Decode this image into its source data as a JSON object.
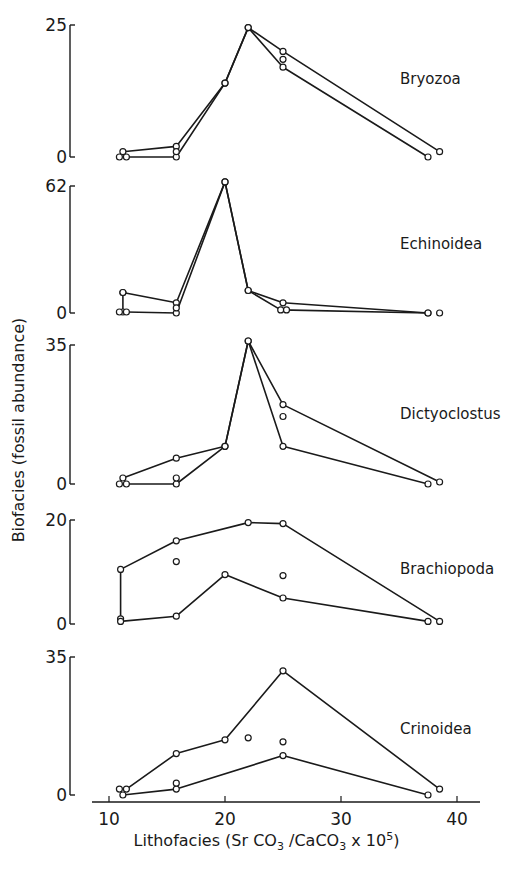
{
  "chart_data": {
    "type": "line",
    "title": "",
    "xlabel": "Lithofacies (Sr CO3 / CaCO3 x 10^5)",
    "xlabel_parts": {
      "pre": "Lithofacies (Sr CO",
      "sub1": "3",
      "mid": " /CaCO",
      "sub2": "3",
      "post": " x 10",
      "sup": "5",
      "close": ")"
    },
    "ylabel": "Biofacies (fossil abundance)",
    "xlim": [
      8,
      42
    ],
    "xticks": [
      10,
      20,
      30,
      40
    ],
    "grid": false,
    "legend": "none (panel labels at right)",
    "panels": [
      {
        "name": "Bryozoa",
        "ylim": [
          0,
          25
        ],
        "yticks": [
          "0",
          "25"
        ],
        "series": [
          {
            "name": "line A",
            "points": [
              [
                11.2,
                1
              ],
              [
                15.8,
                2
              ],
              [
                20,
                14
              ],
              [
                22,
                24.5
              ],
              [
                25,
                20
              ],
              [
                38.5,
                1
              ]
            ]
          },
          {
            "name": "line B",
            "points": [
              [
                11.5,
                0
              ],
              [
                15.8,
                0
              ],
              [
                20,
                14
              ],
              [
                22,
                24.5
              ],
              [
                25,
                17
              ],
              [
                37.5,
                0
              ]
            ]
          },
          {
            "name": "unconnected",
            "points": [
              [
                10.9,
                0
              ],
              [
                15.8,
                1
              ],
              [
                25,
                18.5
              ]
            ]
          }
        ]
      },
      {
        "name": "Echinoidea",
        "ylim": [
          0,
          62
        ],
        "yticks": [
          "0",
          "62"
        ],
        "series": [
          {
            "name": "line A",
            "points": [
              [
                11.2,
                10
              ],
              [
                11.2,
                0.5
              ]
            ]
          },
          {
            "name": "line B",
            "points": [
              [
                11.2,
                10
              ],
              [
                15.8,
                5
              ],
              [
                20,
                64
              ],
              [
                22,
                11
              ],
              [
                25,
                5
              ],
              [
                37.5,
                0
              ]
            ]
          },
          {
            "name": "line C",
            "points": [
              [
                11.5,
                0.5
              ],
              [
                15.8,
                0
              ],
              [
                20,
                64
              ],
              [
                22,
                11
              ],
              [
                24.8,
                1.5
              ],
              [
                37.5,
                0
              ]
            ]
          },
          {
            "name": "unconnected",
            "points": [
              [
                10.9,
                0.5
              ],
              [
                15.8,
                2.5
              ],
              [
                25.3,
                1.5
              ],
              [
                38.5,
                0
              ]
            ]
          }
        ]
      },
      {
        "name": "Dictyoclostus",
        "ylim": [
          0,
          35
        ],
        "yticks": [
          "0",
          "35"
        ],
        "series": [
          {
            "name": "line A",
            "points": [
              [
                11.2,
                1.5
              ],
              [
                15.8,
                6.5
              ],
              [
                20,
                9.5
              ],
              [
                22,
                36
              ],
              [
                25,
                20
              ],
              [
                38.5,
                0.5
              ]
            ]
          },
          {
            "name": "line B",
            "points": [
              [
                11.5,
                0
              ],
              [
                15.8,
                0
              ],
              [
                20,
                9.5
              ],
              [
                22,
                36
              ],
              [
                25,
                9.5
              ],
              [
                37.5,
                0
              ]
            ]
          },
          {
            "name": "unconnected",
            "points": [
              [
                10.9,
                0
              ],
              [
                15.8,
                1.5
              ],
              [
                25,
                17
              ]
            ]
          }
        ]
      },
      {
        "name": "Brachiopoda",
        "ylim": [
          0,
          20
        ],
        "yticks": [
          "0",
          "20"
        ],
        "series": [
          {
            "name": "line A",
            "points": [
              [
                11,
                1
              ],
              [
                11,
                10.5
              ],
              [
                15.8,
                16
              ],
              [
                22,
                19.5
              ],
              [
                25,
                19.3
              ],
              [
                38.5,
                0.5
              ]
            ]
          },
          {
            "name": "line B",
            "points": [
              [
                11,
                0.5
              ],
              [
                15.8,
                1.5
              ],
              [
                20,
                9.5
              ],
              [
                25,
                5
              ],
              [
                37.5,
                0.5
              ]
            ]
          },
          {
            "name": "unconnected",
            "points": [
              [
                15.8,
                12
              ],
              [
                25,
                9.3
              ]
            ]
          }
        ]
      },
      {
        "name": "Crinoidea",
        "ylim": [
          0,
          35
        ],
        "yticks": [
          "0",
          "35"
        ],
        "series": [
          {
            "name": "line A",
            "points": [
              [
                11.5,
                1.5
              ],
              [
                15.8,
                10.5
              ],
              [
                20,
                14
              ],
              [
                25,
                31.5
              ],
              [
                38.5,
                1.5
              ]
            ]
          },
          {
            "name": "line B",
            "points": [
              [
                11.2,
                0
              ],
              [
                15.8,
                1.5
              ],
              [
                25,
                10
              ],
              [
                37.5,
                0
              ]
            ]
          },
          {
            "name": "unconnected",
            "points": [
              [
                10.9,
                1.5
              ],
              [
                15.8,
                3
              ],
              [
                22,
                14.5
              ],
              [
                25,
                13.5
              ]
            ]
          }
        ]
      }
    ]
  }
}
